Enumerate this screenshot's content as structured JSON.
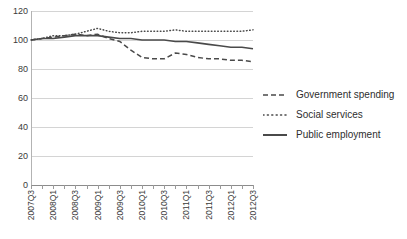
{
  "chart_data": {
    "type": "line",
    "title": "",
    "xlabel": "",
    "ylabel": "",
    "ylim": [
      0,
      120
    ],
    "ytick_values": [
      120,
      100,
      80,
      60,
      40,
      20,
      0
    ],
    "grid": true,
    "legend_position": "right",
    "x": [
      "2007Q3",
      "2007Q4",
      "2008Q1",
      "2008Q2",
      "2008Q3",
      "2008Q4",
      "2009Q1",
      "2009Q2",
      "2009Q3",
      "2009Q4",
      "2010Q1",
      "2010Q2",
      "2010Q3",
      "2010Q4",
      "2011Q1",
      "2011Q2",
      "2011Q3",
      "2011Q4",
      "2012Q1",
      "2012Q2",
      "2012Q3"
    ],
    "xtick_labels": [
      "2007Q3",
      "",
      "2008Q1",
      "",
      "2008Q3",
      "",
      "2009Q1",
      "",
      "2009Q3",
      "",
      "2010Q1",
      "",
      "2010Q3",
      "",
      "2011Q1",
      "",
      "2011Q3",
      "",
      "2012Q1",
      "",
      "2012Q3"
    ],
    "xtick_labels_shown": [
      "2007Q3",
      "2008Q1",
      "2008Q3",
      "2009Q1",
      "2009Q3",
      "2010Q1",
      "2010Q3",
      "2011Q1",
      "2011Q3",
      "2012Q1",
      "2012Q3"
    ],
    "series": [
      {
        "name": "Government spending",
        "style": "dashed",
        "color": "#4a4a4a",
        "values": [
          100,
          101,
          102,
          103,
          104,
          103,
          104,
          101,
          99,
          93,
          88,
          87,
          87,
          91,
          90,
          88,
          87,
          87,
          86,
          86,
          85
        ]
      },
      {
        "name": "Social services",
        "style": "dotted",
        "color": "#4a4a4a",
        "values": [
          100,
          101,
          103,
          103,
          104,
          106,
          108,
          106,
          105,
          105,
          106,
          106,
          106,
          107,
          106,
          106,
          106,
          106,
          106,
          106,
          107
        ]
      },
      {
        "name": "Public employment",
        "style": "solid",
        "color": "#4a4a4a",
        "values": [
          100,
          101,
          101,
          102,
          103,
          103,
          103,
          102,
          101,
          101,
          100,
          100,
          100,
          99,
          99,
          98,
          97,
          96,
          95,
          95,
          94
        ]
      }
    ]
  },
  "legend": {
    "items": [
      {
        "label": "Government spending",
        "style": "dashed"
      },
      {
        "label": "Social services",
        "style": "dotted"
      },
      {
        "label": "Public employment",
        "style": "solid"
      }
    ]
  }
}
